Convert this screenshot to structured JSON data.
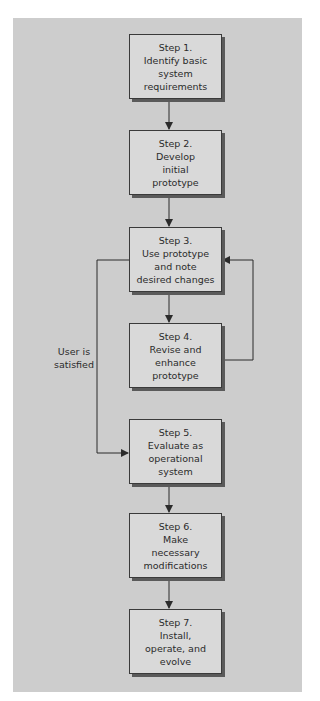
{
  "diagram": {
    "type": "flowchart",
    "colors": {
      "panel": "#cdcdcd",
      "box": "#d9d9d9",
      "line": "#2b2b2b",
      "shadow": "#5a5a5a"
    },
    "steps": [
      {
        "title": "Step 1.",
        "lines": [
          "Identify basic",
          "system",
          "requirements"
        ]
      },
      {
        "title": "Step 2.",
        "lines": [
          "Develop",
          "initial",
          "prototype"
        ]
      },
      {
        "title": "Step 3.",
        "lines": [
          "Use prototype",
          "and note",
          "desired changes"
        ]
      },
      {
        "title": "Step 4.",
        "lines": [
          "Revise and",
          "enhance",
          "prototype"
        ]
      },
      {
        "title": "Step 5.",
        "lines": [
          "Evaluate as",
          "operational",
          "system"
        ]
      },
      {
        "title": "Step 6.",
        "lines": [
          "Make",
          "necessary",
          "modifications"
        ]
      },
      {
        "title": "Step 7.",
        "lines": [
          "Install,",
          "operate, and",
          "evolve"
        ]
      }
    ],
    "edges": [
      {
        "from": "Step 1.",
        "to": "Step 2."
      },
      {
        "from": "Step 2.",
        "to": "Step 3."
      },
      {
        "from": "Step 3.",
        "to": "Step 4."
      },
      {
        "from": "Step 4.",
        "to": "Step 3.",
        "kind": "loop-back"
      },
      {
        "from": "Step 3.",
        "to": "Step 5.",
        "label": "User is satisfied"
      },
      {
        "from": "Step 5.",
        "to": "Step 6."
      },
      {
        "from": "Step 6.",
        "to": "Step 7."
      }
    ],
    "satisfied_label": {
      "line1": "User is",
      "line2": "satisfied"
    }
  }
}
